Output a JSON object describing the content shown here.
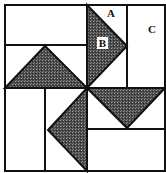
{
  "diagram": {
    "type": "quilt-block",
    "colors": {
      "line": "#111111",
      "background": "#ffffff",
      "shade": "#3a3a3a"
    },
    "labels": {
      "a": "A",
      "b": "B",
      "c": "C"
    }
  }
}
